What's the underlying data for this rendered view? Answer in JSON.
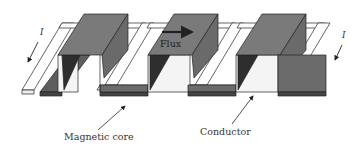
{
  "figure": {
    "labels": {
      "magnetic_core": "Magnetic core",
      "conductor": "Conductor",
      "flux": "Flux",
      "current_left": "I",
      "current_right": "I"
    },
    "colors": {
      "core_top": "#7a7a7a",
      "core_side": "#5e5e5e",
      "core_dark": "#3a3a3a",
      "conductor": "#ffffff",
      "outline": "#222222"
    }
  }
}
